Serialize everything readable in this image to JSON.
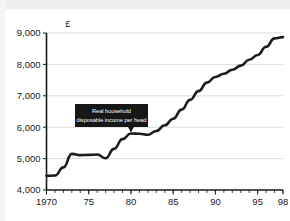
{
  "chart_data": {
    "type": "line",
    "title": "",
    "subtitle": "",
    "xlabel": "",
    "ylabel": "",
    "unit_label": "£",
    "xlim": [
      1970,
      1998
    ],
    "ylim": [
      4000,
      9000
    ],
    "grid": true,
    "legend": false,
    "y_ticks": [
      4000,
      5000,
      6000,
      7000,
      8000,
      9000
    ],
    "y_tick_labels": [
      "4,000",
      "5,000",
      "6,000",
      "7,000",
      "8,000",
      "9,000"
    ],
    "x_ticks": [
      1970,
      1975,
      1980,
      1985,
      1990,
      1995,
      1998
    ],
    "x_tick_labels": [
      "1970",
      "75",
      "80",
      "85",
      "90",
      "95",
      "98"
    ],
    "x_minor_tick_interval": 1,
    "line_color": "#1c1c1c",
    "gridline_color": "#d2d2d2",
    "axis_color": "#1a1a1a",
    "series": [
      {
        "name": "Real household disposable income per head",
        "x": [
          1970,
          1971,
          1972,
          1973,
          1974,
          1975,
          1976,
          1977,
          1978,
          1979,
          1980,
          1981,
          1982,
          1983,
          1984,
          1985,
          1986,
          1987,
          1988,
          1989,
          1990,
          1991,
          1992,
          1993,
          1994,
          1995,
          1996,
          1997,
          1998
        ],
        "values": [
          4450,
          4460,
          4720,
          5150,
          5110,
          5120,
          5130,
          5010,
          5310,
          5620,
          5800,
          5790,
          5760,
          5880,
          6060,
          6270,
          6560,
          6870,
          7150,
          7420,
          7600,
          7700,
          7830,
          7960,
          8150,
          8300,
          8560,
          8830,
          8870
        ]
      }
    ],
    "annotations": [
      {
        "name": "series-callout",
        "lines": [
          "Real household",
          "disposable income per head"
        ],
        "text_color": "#ffffff",
        "box_color": "#171717",
        "points_to_year": 1980,
        "points_to_value": 5800
      }
    ]
  }
}
